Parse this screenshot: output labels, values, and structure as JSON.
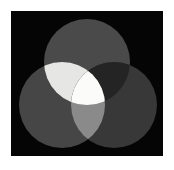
{
  "figure": {
    "width": 174,
    "height": 170,
    "page_background": "#ffffff"
  },
  "panel": {
    "x": 11,
    "y": 11,
    "width": 152,
    "height": 145,
    "background_color": "#050505",
    "border_color": "#000000"
  },
  "chart_data": {
    "type": "venn",
    "subtitle": "",
    "xlabel": "",
    "ylabel": "",
    "legend_position": "none",
    "grid": false,
    "background": "#050505",
    "set_count": 3,
    "sets": [
      {
        "name": "top",
        "label": "Top circle",
        "cx": 87,
        "cy": 62,
        "r": 43,
        "fill": "#4a4a4a",
        "value": 1
      },
      {
        "name": "left",
        "label": "Left circle",
        "cx": 62,
        "cy": 105,
        "r": 43,
        "fill": "#464646",
        "value": 1
      },
      {
        "name": "right",
        "label": "Right circle",
        "cx": 114,
        "cy": 105,
        "r": 43,
        "fill": "#383838",
        "value": 1
      }
    ],
    "intersections": [
      {
        "name": "top-left",
        "label": "Top ∩ Left",
        "members": [
          "top",
          "left"
        ],
        "fill": "#e6e6e4",
        "value": 1
      },
      {
        "name": "top-right",
        "label": "Top ∩ Right",
        "members": [
          "top",
          "right"
        ],
        "fill": "#242424",
        "value": 1
      },
      {
        "name": "left-right",
        "label": "Left ∩ Right",
        "members": [
          "left",
          "right"
        ],
        "fill": "#8a8a8a",
        "value": 1
      },
      {
        "name": "top-left-right",
        "label": "Top ∩ Left ∩ Right",
        "members": [
          "top",
          "left",
          "right"
        ],
        "fill": "#fbfbf9",
        "value": 1
      }
    ],
    "colors": {
      "background": "#050505",
      "set_top": "#4a4a4a",
      "set_left": "#464646",
      "set_right": "#383838",
      "inter_top_left": "#e6e6e4",
      "inter_top_right": "#242424",
      "inter_left_right": "#8a8a8a",
      "inter_all": "#fbfbf9"
    }
  }
}
